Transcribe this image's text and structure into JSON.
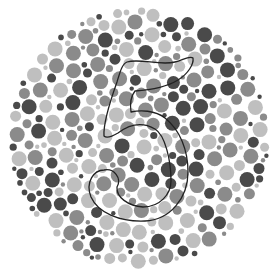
{
  "plate": {
    "type": "color-vision-test-plate",
    "hidden_figure": "5",
    "center": [
      139,
      138
    ],
    "radius": 131,
    "background": "#ffffff",
    "dot_colors": {
      "dark": "#4a4a4a",
      "medium": "#8b8b8b",
      "light": "#bfbfbf"
    },
    "outline": {
      "color": "#222222",
      "width": 1.3,
      "path": "M127,62 C140,58 160,66 175,62 C183,60 190,55 193,58 C194,64 188,74 178,80 C165,88 150,90 135,91 C131,96 130,105 131,112 C140,110 155,110 165,118 C180,130 188,150 188,172 C188,198 170,220 145,221 C120,222 98,213 91,197 C85,182 94,170 104,170 C114,168 122,178 117,187 C116,197 128,206 143,207 C160,207 171,194 171,181 C171,160 165,135 155,129 C143,122 130,124 118,133 C113,136 107,139 104,136 C103,122 112,96 117,82 C120,72 122,64 127,62 Z"
    }
  }
}
